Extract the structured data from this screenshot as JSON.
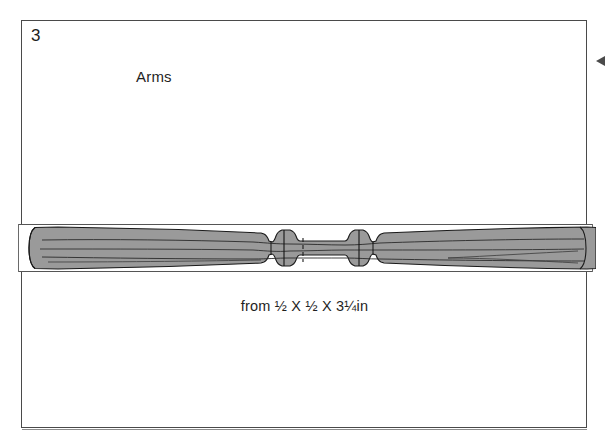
{
  "page": {
    "background_color": "#ffffff",
    "width": 609,
    "height": 443
  },
  "plate": {
    "figure_number": "3",
    "title": "Arms",
    "caption": "from ½ X ½ X 3¼ in",
    "caption_display": "from ½ X ½ X 3¼in",
    "frame_color": "#4a4a4a"
  },
  "drawing": {
    "name": "turned-arm-spindle",
    "fill_color": "#9a9a9a",
    "outline_color": "#1a1a1a",
    "stock_outline_color": "#555555",
    "description": "Symmetrical turned spindle shown inside the square stock blank, tapering from rounded ends toward two beads flanking a narrow central section, with a dashed vertical centerline.",
    "stock": {
      "top": 224,
      "bottom": 272,
      "left": 18,
      "right": 593
    },
    "features": [
      {
        "name": "left-rounded-end",
        "x": 30
      },
      {
        "name": "left-taper",
        "x": 60
      },
      {
        "name": "left-bead",
        "x": 266
      },
      {
        "name": "center-section",
        "x": 304
      },
      {
        "name": "centerline-dashed",
        "x": 303
      },
      {
        "name": "right-bead",
        "x": 349
      },
      {
        "name": "right-taper",
        "x": 450
      },
      {
        "name": "right-rounded-end",
        "x": 580
      }
    ]
  },
  "markers": {
    "margin_arrow": {
      "name": "margin-pointer",
      "direction": "left",
      "color": "#2b2b2b"
    }
  }
}
